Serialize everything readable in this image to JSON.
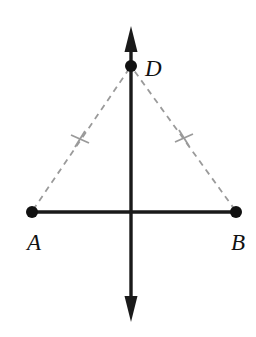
{
  "figure": {
    "background_color": "#ffffff",
    "solid_color": "#1a1a1a",
    "dashed_color": "#9a9a9a",
    "canvas": {
      "width": 256,
      "height": 337
    },
    "points": [
      {
        "id": "A",
        "label": "A",
        "x": 32,
        "y": 212,
        "label_x": 27,
        "label_y": 250,
        "dot_radius": 6
      },
      {
        "id": "B",
        "label": "B",
        "x": 236,
        "y": 212,
        "label_x": 231,
        "label_y": 250,
        "dot_radius": 6
      },
      {
        "id": "D",
        "label": "D",
        "x": 131,
        "y": 66,
        "label_x": 145,
        "label_y": 76,
        "dot_radius": 6
      }
    ],
    "segments": [
      {
        "id": "AB",
        "from": "A",
        "to": "B",
        "style": "solid",
        "x1": 32,
        "y1": 212,
        "x2": 236,
        "y2": 212,
        "width": 3.4
      },
      {
        "id": "AD",
        "from": "A",
        "to": "D",
        "style": "dashed",
        "x1": 33,
        "y1": 210,
        "x2": 129,
        "y2": 69,
        "width": 1.8
      },
      {
        "id": "BD",
        "from": "B",
        "to": "D",
        "style": "dashed",
        "x1": 235,
        "y1": 210,
        "x2": 133,
        "y2": 69,
        "width": 1.8
      }
    ],
    "lines": [
      {
        "id": "vertical-line",
        "description": "double-headed vertical line through midpoint of AB and through D",
        "style": "solid",
        "x1": 131,
        "y1": 26,
        "x2": 131,
        "y2": 322,
        "width": 3.4,
        "arrow_top": true,
        "arrow_bottom": true
      }
    ],
    "tick_marks": [
      {
        "id": "tick-AD",
        "on_segment": "AD",
        "x": 80,
        "y": 139,
        "count": 1
      },
      {
        "id": "tick-BD",
        "on_segment": "BD",
        "x": 184,
        "y": 138,
        "count": 1
      }
    ],
    "dash_pattern": "6 5"
  }
}
